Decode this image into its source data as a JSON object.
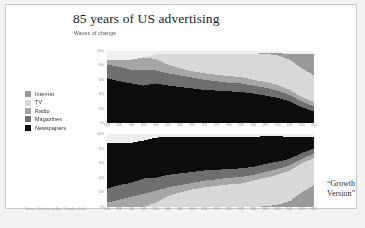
{
  "slide": {
    "title": "85 years of US advertising",
    "subtitle": "Waves of change",
    "growth_note_line1": "“Growth",
    "growth_note_line2": "Version”",
    "source": "Source: Advertising Age / Douglas Galbi"
  },
  "legend": {
    "items": [
      {
        "label": "Internet",
        "color": "#9a9a9a"
      },
      {
        "label": "TV",
        "color": "#d8d8d8"
      },
      {
        "label": "Radio",
        "color": "#a6a6a6"
      },
      {
        "label": "Magazines",
        "color": "#6f6f6f"
      },
      {
        "label": "Newspapers",
        "color": "#0d0d0d"
      }
    ]
  },
  "colors": {
    "internet": "#9a9a9a",
    "tv": "#d8d8d8",
    "radio": "#a6a6a6",
    "magazines": "#6f6f6f",
    "newspapers": "#0d0d0d",
    "plot_background": "#efefef",
    "axis_text": "#8a8a8a",
    "slide_background": "#ffffff",
    "slide_border": "#c8c8c8"
  },
  "chart_data": [
    {
      "id": "top",
      "type": "area",
      "title": "",
      "stacked": true,
      "percent": true,
      "grid": false,
      "legend_position": "left-outside",
      "xlabel": "",
      "ylabel": "",
      "ylim": [
        0,
        100
      ],
      "yticks": [
        0,
        20,
        40,
        60,
        80,
        100
      ],
      "ytick_labels": [
        "0%",
        "20%",
        "40%",
        "60%",
        "80%",
        "100%"
      ],
      "x": [
        1930,
        1935,
        1940,
        1945,
        1950,
        1955,
        1960,
        1965,
        1970,
        1975,
        1980,
        1985,
        1990,
        1995,
        2000,
        2005,
        2010,
        2015
      ],
      "xtick_labels": [
        "1930",
        "1935",
        "1940",
        "1945",
        "1950",
        "1955",
        "1960",
        "1965",
        "1970",
        "1975",
        "1980",
        "1985",
        "1990",
        "1995",
        "2000",
        "2005",
        "2010",
        "2015"
      ],
      "stack_order_bottom_to_top": [
        "Newspapers",
        "Magazines",
        "Radio",
        "TV",
        "Internet"
      ],
      "series": [
        {
          "name": "Newspapers",
          "color": "#0d0d0d",
          "values": [
            62,
            58,
            55,
            52,
            55,
            52,
            50,
            48,
            46,
            45,
            44,
            43,
            41,
            38,
            35,
            30,
            22,
            16
          ]
        },
        {
          "name": "Magazines",
          "color": "#6f6f6f",
          "values": [
            19,
            20,
            19,
            21,
            18,
            17,
            16,
            15,
            14,
            13,
            12,
            12,
            11,
            11,
            10,
            9,
            8,
            7
          ]
        },
        {
          "name": "Radio",
          "color": "#a6a6a6",
          "values": [
            6,
            10,
            14,
            18,
            16,
            12,
            10,
            9,
            9,
            9,
            9,
            9,
            8,
            8,
            8,
            7,
            6,
            6
          ]
        },
        {
          "name": "TV",
          "color": "#d8d8d8",
          "values": [
            0,
            0,
            0,
            0,
            6,
            15,
            20,
            24,
            27,
            29,
            31,
            32,
            36,
            39,
            41,
            42,
            40,
            37
          ]
        },
        {
          "name": "Internet",
          "color": "#9a9a9a",
          "values": [
            0,
            0,
            0,
            0,
            0,
            0,
            0,
            0,
            0,
            0,
            0,
            0,
            0,
            1,
            3,
            8,
            20,
            30
          ]
        }
      ]
    },
    {
      "id": "bottom",
      "type": "area",
      "title": "",
      "stacked": true,
      "percent": true,
      "grid": false,
      "legend_position": "left-outside",
      "xlabel": "",
      "ylabel": "",
      "ylim": [
        0,
        100
      ],
      "yticks": [
        0,
        20,
        40,
        60,
        80,
        100
      ],
      "ytick_labels": [
        "0%",
        "20%",
        "40%",
        "60%",
        "80%",
        "100%"
      ],
      "x": [
        1930,
        1935,
        1940,
        1945,
        1950,
        1955,
        1960,
        1965,
        1970,
        1975,
        1980,
        1985,
        1990,
        1995,
        2000,
        2005,
        2010,
        2015
      ],
      "xtick_labels": [
        "1930",
        "1935",
        "1940",
        "1945",
        "1950",
        "1955",
        "1960",
        "1965",
        "1970",
        "1975",
        "1980",
        "1985",
        "1990",
        "1995",
        "2000",
        "2005",
        "2010",
        "2015"
      ],
      "stack_order_bottom_to_top": [
        "Internet",
        "TV",
        "Radio",
        "Magazines",
        "Newspapers"
      ],
      "series": [
        {
          "name": "Internet",
          "color": "#9a9a9a",
          "values": [
            0,
            0,
            0,
            0,
            0,
            0,
            0,
            0,
            0,
            0,
            0,
            0,
            0,
            1,
            3,
            8,
            20,
            30
          ]
        },
        {
          "name": "TV",
          "color": "#d8d8d8",
          "values": [
            0,
            0,
            0,
            0,
            6,
            15,
            20,
            24,
            27,
            29,
            31,
            32,
            36,
            39,
            41,
            42,
            40,
            37
          ]
        },
        {
          "name": "Radio",
          "color": "#a6a6a6",
          "values": [
            6,
            10,
            14,
            18,
            16,
            12,
            10,
            9,
            9,
            9,
            9,
            9,
            8,
            8,
            8,
            7,
            6,
            6
          ]
        },
        {
          "name": "Magazines",
          "color": "#6f6f6f",
          "values": [
            19,
            20,
            19,
            21,
            18,
            17,
            16,
            15,
            14,
            13,
            12,
            12,
            11,
            11,
            10,
            9,
            8,
            7
          ]
        },
        {
          "name": "Newspapers",
          "color": "#0d0d0d",
          "values": [
            62,
            58,
            55,
            52,
            55,
            52,
            50,
            48,
            46,
            45,
            44,
            43,
            41,
            38,
            35,
            30,
            22,
            16
          ]
        }
      ]
    }
  ]
}
